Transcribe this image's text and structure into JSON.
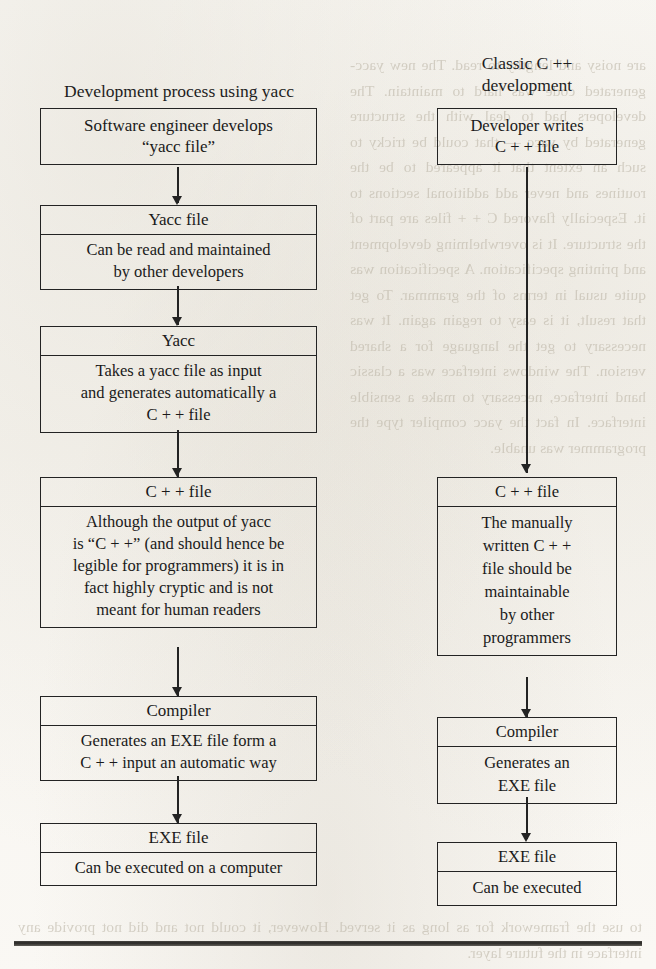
{
  "columns": {
    "left": {
      "title": "Development process using yacc",
      "nodes": [
        {
          "head": "Software engineer develops\n“yacc file”",
          "body": ""
        },
        {
          "head": "Yacc file",
          "body": "Can be read and maintained\nby other developers"
        },
        {
          "head": "Yacc",
          "body": "Takes a yacc file as input\nand generates automatically a\nC + + file"
        },
        {
          "head": "C + + file",
          "body": "Although the output of yacc\nis “C + +” (and should hence be\nlegible for programmers) it is in\nfact highly cryptic and is not\nmeant for human readers"
        },
        {
          "head": "Compiler",
          "body": "Generates an EXE file form a\nC  + + input an automatic way"
        },
        {
          "head": "EXE file",
          "body": "Can be executed on a computer"
        }
      ]
    },
    "right": {
      "title": "Classic C ++\ndevelopment",
      "nodes": [
        {
          "head": "Developer writes\nC + + file",
          "body": ""
        },
        {
          "head": "C + + file",
          "body": "The manually\nwritten C + +\nfile should be\nmaintainable\nby other\nprogrammers"
        },
        {
          "head": "Compiler",
          "body": "Generates an\nEXE file"
        },
        {
          "head": "EXE file",
          "body": "Can be executed"
        }
      ]
    }
  },
  "page": {
    "ghost_right": "are noisy and lengthy to read. The new yacc-generated code was hard to maintain. The developers had to deal with the structure generated by yacc — that could be tricky to such an extent that it appeared to be the routines and never add additional sections to it. Especially flavored C + + files are part of the structure. It is overwhelming development and printing specification. A specification was quite usual in terms of the grammar. To get that result, it is easy to regain again. It was necessary to get the language for a shared version. The windows interface was a classic hand interface, necessary to make a sensible interface. In fact the yacc compiler type the programmer was unable.",
    "ghost_bottom": "to use the framework for as long as it served. However, it could not and did not provide any interface in the future layer."
  },
  "colors": {
    "ink": "#232323",
    "paper": "#faf8f4",
    "ghost": "#b9b2a3",
    "rule": "#191816"
  }
}
